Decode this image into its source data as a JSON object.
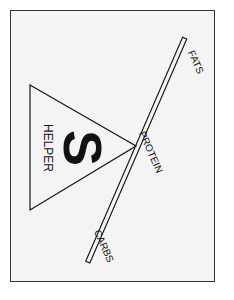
{
  "diagram": {
    "title_letter": "S",
    "fulcrum_label": "HELPER",
    "beam_labels": {
      "top": "FATS",
      "middle": "PROTEIN",
      "bottom": "CARBS"
    },
    "colors": {
      "background": "#f4f4f4",
      "border": "#333333",
      "stroke": "#111111"
    }
  }
}
